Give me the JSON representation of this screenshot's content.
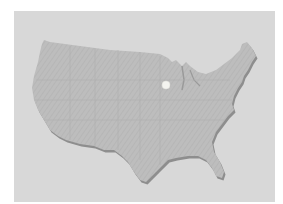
{
  "map": {
    "region": "United States (contiguous)",
    "marker": {
      "label": "location-marker",
      "x": 166,
      "y": 85
    },
    "colors": {
      "page": "#ffffff",
      "panel": "#d8d8d8",
      "land": "#bcbcbc",
      "shadow": "#8e8e8e",
      "marker": "#f4f4f0"
    }
  }
}
